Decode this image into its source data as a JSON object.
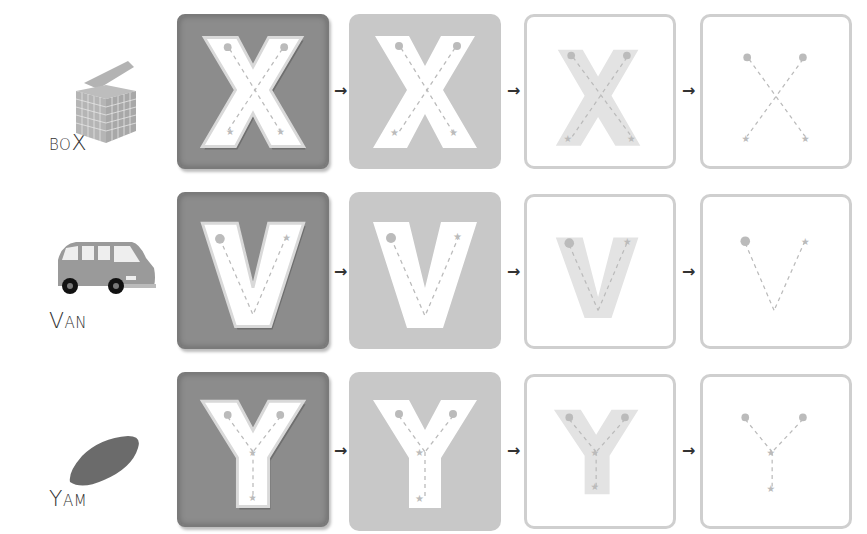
{
  "worksheet": {
    "title": "Letter tracing: X, V, Y",
    "arrow_glyph": "→",
    "colors": {
      "card_dark": "#8c8c8c",
      "card_medium": "#c8c8c8",
      "card_outline": "#cfcfcf",
      "letter_fill": "#ffffff",
      "trace_band": "#e3e3e3",
      "guide": "#b0b0b0"
    },
    "rows": [
      {
        "letter": "X",
        "word": {
          "first": "B",
          "rest_small": "O",
          "highlight": "X"
        },
        "picture": "box-icon",
        "stages": [
          "embossed",
          "filled",
          "shaded",
          "dashed-only"
        ],
        "stroke_starts": [
          "1",
          "2"
        ]
      },
      {
        "letter": "V",
        "word": {
          "first": "V",
          "rest_small": "AN",
          "highlight": ""
        },
        "picture": "van-icon",
        "stages": [
          "embossed",
          "filled",
          "shaded",
          "dashed-only"
        ],
        "stroke_starts": [
          "•"
        ]
      },
      {
        "letter": "Y",
        "word": {
          "first": "Y",
          "rest_small": "AM",
          "highlight": ""
        },
        "picture": "yam-icon",
        "stages": [
          "embossed",
          "filled",
          "shaded",
          "dashed-only"
        ],
        "stroke_starts": [
          "1",
          "2"
        ]
      }
    ]
  }
}
